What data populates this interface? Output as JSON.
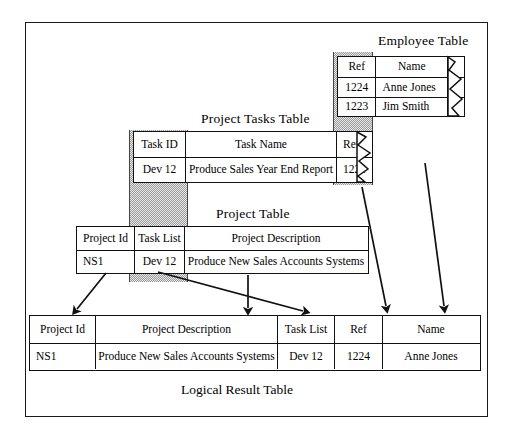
{
  "diagram": {
    "bottom_caption": "Logical Result Table"
  },
  "employee_table": {
    "title": "Employee Table",
    "headers": [
      "Ref",
      "Name"
    ],
    "rows": [
      [
        "1224",
        "Anne Jones"
      ],
      [
        "1223",
        "Jim Smith"
      ]
    ]
  },
  "project_tasks_table": {
    "title": "Project Tasks Table",
    "headers": [
      "Task ID",
      "Task Name",
      "Ref"
    ],
    "rows": [
      [
        "Dev 12",
        "Produce Sales Year End Report",
        "1224"
      ]
    ]
  },
  "project_table": {
    "title": "Project Table",
    "headers": [
      "Project Id",
      "Task List",
      "Project Description"
    ],
    "rows": [
      [
        "NS1",
        "Dev 12",
        "Produce New Sales Accounts Systems"
      ]
    ]
  },
  "result_table": {
    "headers": [
      "Project Id",
      "Project Description",
      "Task List",
      "Ref",
      "Name"
    ],
    "rows": [
      [
        "NS1",
        "Produce New Sales Accounts Systems",
        "Dev 12",
        "1224",
        "Anne Jones"
      ]
    ]
  },
  "colors": {
    "ink": "#111111",
    "band": "#c9c9c9",
    "paper": "#ffffff"
  }
}
